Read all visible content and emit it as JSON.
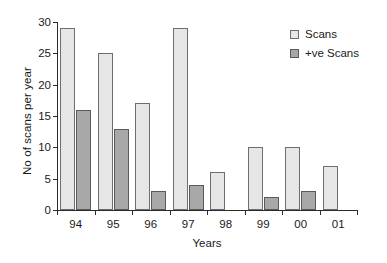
{
  "chart_data": {
    "type": "bar",
    "title": "",
    "xlabel": "Years",
    "ylabel": "No of scans per year",
    "categories": [
      "94",
      "95",
      "96",
      "97",
      "98",
      "99",
      "00",
      "01"
    ],
    "series": [
      {
        "name": "Scans",
        "color": "#e6e6e6",
        "values": [
          29,
          25,
          17,
          29,
          6,
          10,
          10,
          7
        ]
      },
      {
        "name": "+ve Scans",
        "color": "#a8a8a8",
        "values": [
          16,
          13,
          3,
          4,
          0,
          2,
          3,
          0
        ]
      }
    ],
    "ylim": [
      0,
      30
    ],
    "yticks": [
      0,
      5,
      10,
      15,
      20,
      25,
      30
    ],
    "ytick_labels": [
      "0",
      "5",
      "10",
      "15",
      "20",
      "25",
      "30"
    ],
    "grid": false,
    "legend_position": "top-right"
  },
  "legend": {
    "items": [
      {
        "label": "Scans"
      },
      {
        "label": "+ve Scans"
      }
    ]
  }
}
